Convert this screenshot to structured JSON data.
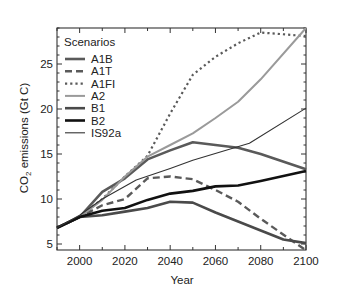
{
  "chart_data": {
    "type": "line",
    "title": "",
    "xlabel": "Year",
    "ylabel": "CO2 emissions (Gt C)",
    "ylabel_parts": {
      "pre": "CO",
      "sub": "2",
      "post": " emissions (Gt C)"
    },
    "xlim": [
      1990,
      2100
    ],
    "ylim": [
      4.3,
      29.0
    ],
    "xticks": [
      2000,
      2020,
      2040,
      2060,
      2080,
      2100
    ],
    "yticks": [
      5,
      10,
      15,
      20,
      25
    ],
    "grid": false,
    "legend": {
      "title": "Scenarios",
      "position": "upper left"
    },
    "series": [
      {
        "name": "A1B",
        "style": "solid",
        "color": "#5a5a5a",
        "width": 2.6,
        "x": [
          1990,
          2000,
          2010,
          2020,
          2030,
          2040,
          2050,
          2070,
          2080,
          2100
        ],
        "values": [
          6.8,
          8.0,
          10.8,
          12.3,
          14.4,
          15.4,
          16.3,
          15.7,
          15.0,
          13.3
        ]
      },
      {
        "name": "A1T",
        "style": "dashed",
        "color": "#5a5a5a",
        "width": 2.4,
        "x": [
          1990,
          2000,
          2010,
          2020,
          2030,
          2040,
          2050,
          2060,
          2070,
          2080,
          2100
        ],
        "values": [
          6.8,
          8.0,
          9.3,
          10.0,
          12.3,
          12.5,
          12.2,
          11.0,
          9.7,
          7.8,
          4.3
        ]
      },
      {
        "name": "A1FI",
        "style": "dotted",
        "color": "#5a5a5a",
        "width": 2.2,
        "x": [
          1990,
          2000,
          2010,
          2020,
          2030,
          2040,
          2050,
          2060,
          2070,
          2080,
          2100
        ],
        "values": [
          6.8,
          8.0,
          10.0,
          12.5,
          14.8,
          19.5,
          23.8,
          25.8,
          27.3,
          28.5,
          28.1
        ]
      },
      {
        "name": "A2",
        "style": "solid",
        "color": "#9a9a9a",
        "width": 2.0,
        "x": [
          1990,
          2000,
          2010,
          2020,
          2030,
          2040,
          2050,
          2060,
          2070,
          2080,
          2100
        ],
        "values": [
          6.8,
          8.0,
          9.9,
          12.5,
          14.7,
          16.0,
          17.3,
          19.0,
          20.8,
          23.3,
          29.0
        ]
      },
      {
        "name": "B1",
        "style": "solid",
        "color": "#4a4a4a",
        "width": 2.6,
        "x": [
          1990,
          2000,
          2010,
          2020,
          2030,
          2040,
          2050,
          2060,
          2070,
          2080,
          2090,
          2100
        ],
        "values": [
          6.8,
          8.0,
          8.2,
          8.6,
          9.0,
          9.7,
          9.6,
          8.5,
          7.5,
          6.5,
          5.5,
          5.1
        ]
      },
      {
        "name": "B2",
        "style": "solid",
        "color": "#111111",
        "width": 2.6,
        "x": [
          1990,
          2000,
          2010,
          2020,
          2030,
          2040,
          2050,
          2060,
          2070,
          2080,
          2100
        ],
        "values": [
          6.8,
          8.0,
          8.7,
          9.0,
          9.9,
          10.6,
          10.9,
          11.4,
          11.5,
          12.0,
          13.1
        ]
      },
      {
        "name": "IS92a",
        "style": "solid",
        "color": "#333333",
        "width": 1.1,
        "x": [
          1990,
          2000,
          2010,
          2025,
          2040,
          2050,
          2075,
          2100
        ],
        "values": [
          6.8,
          8.2,
          10.0,
          12.1,
          13.4,
          14.3,
          16.2,
          20.1
        ]
      }
    ]
  }
}
